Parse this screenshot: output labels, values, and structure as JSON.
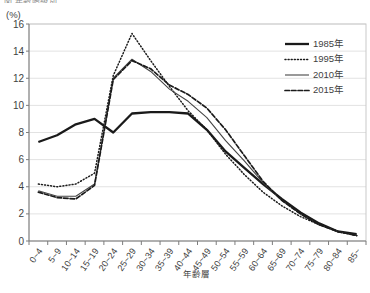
{
  "header": {
    "clipped_title": "図 年齢階級別",
    "unit_label": "(%)"
  },
  "chart_data": {
    "type": "line",
    "title": "",
    "xlabel": "年齢層",
    "ylabel": "(%)",
    "ylim": [
      0,
      16
    ],
    "ytick_step": 2,
    "yticks": [
      "0",
      "2",
      "4",
      "6",
      "8",
      "10",
      "12",
      "14",
      "16"
    ],
    "grid": true,
    "legend_position": "top-right",
    "categories": [
      "0~4",
      "5~9",
      "10~14",
      "15~19",
      "20~24",
      "25~29",
      "30~34",
      "35~39",
      "40~44",
      "45~49",
      "50~54",
      "55~59",
      "60~64",
      "65~69",
      "70~74",
      "75~79",
      "80~84",
      "85~"
    ],
    "series": [
      {
        "name": "1985年",
        "style": "solid-thick",
        "color": "#1a1a1a",
        "width": 2.3,
        "dash": "",
        "values": [
          7.3,
          7.8,
          8.6,
          9.0,
          8.0,
          9.4,
          9.5,
          9.5,
          9.4,
          8.2,
          6.6,
          5.4,
          4.2,
          3.1,
          2.1,
          1.3,
          0.7,
          0.5
        ]
      },
      {
        "name": "1995年",
        "style": "dotted",
        "color": "#1a1a1a",
        "width": 1.5,
        "dash": "1,2.1",
        "values": [
          4.2,
          4.0,
          4.2,
          5.0,
          12.2,
          15.3,
          13.3,
          11.4,
          9.6,
          8.2,
          6.4,
          4.9,
          3.6,
          2.6,
          1.8,
          1.2,
          0.7,
          0.4
        ]
      },
      {
        "name": "2010年",
        "style": "solid-thin",
        "color": "#454545",
        "width": 1.1,
        "dash": "",
        "values": [
          3.7,
          3.3,
          3.3,
          4.2,
          12.0,
          13.4,
          12.5,
          11.2,
          10.3,
          9.1,
          7.4,
          5.9,
          4.3,
          3.0,
          2.0,
          1.2,
          0.7,
          0.4
        ]
      },
      {
        "name": "2015年",
        "style": "dashed",
        "color": "#1a1a1a",
        "width": 1.7,
        "dash": "4.5,2",
        "values": [
          3.6,
          3.2,
          3.1,
          4.1,
          11.9,
          13.3,
          12.7,
          11.5,
          10.8,
          9.8,
          8.2,
          6.3,
          4.4,
          3.0,
          2.0,
          1.2,
          0.7,
          0.4
        ]
      }
    ]
  }
}
